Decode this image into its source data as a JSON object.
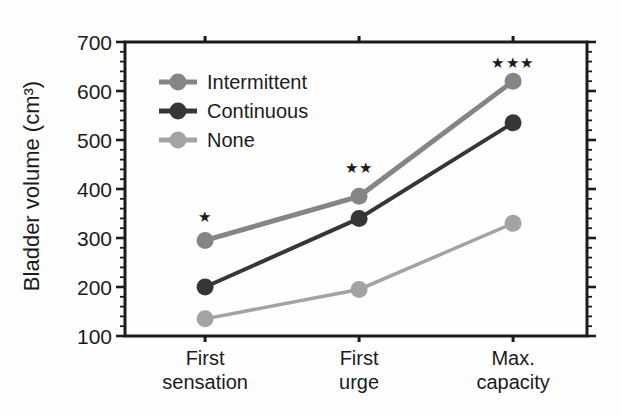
{
  "figure": {
    "background": "#fefefe",
    "axis_color": "#1b1b1b",
    "text_color": "#1b1b1b"
  },
  "chart_data": {
    "type": "line",
    "title": "",
    "xlabel": "",
    "ylabel": "Bladder volume (cm³)",
    "categories": [
      [
        "First",
        "sensation"
      ],
      [
        "First",
        "urge"
      ],
      [
        "Max.",
        "capacity"
      ]
    ],
    "y_axis": {
      "min": 100,
      "max": 700,
      "major_tick_step": 100,
      "minor_tick_step": 20,
      "tick_labels": [
        "700",
        "600",
        "500",
        "400",
        "300",
        "200",
        "100"
      ]
    },
    "series": [
      {
        "name": "Intermittent",
        "values": [
          295,
          385,
          620
        ],
        "color": "#858585",
        "line_width": 5
      },
      {
        "name": "Continuous",
        "values": [
          200,
          340,
          535
        ],
        "color": "#363636",
        "line_width": 4
      },
      {
        "name": "None",
        "values": [
          135,
          195,
          330
        ],
        "color": "#a3a3a3",
        "line_width": 3.5
      }
    ],
    "legend": {
      "position": "top-left-inside",
      "entries": [
        "Intermittent",
        "Continuous",
        "None"
      ]
    },
    "annotations": [
      {
        "text": "*",
        "glyph": "star",
        "category_index": 0,
        "y_value": 345
      },
      {
        "text": "**",
        "glyph": "star",
        "category_index": 1,
        "y_value": 445
      },
      {
        "text": "***",
        "glyph": "star",
        "category_index": 2,
        "y_value": 660
      }
    ],
    "grid": false
  }
}
